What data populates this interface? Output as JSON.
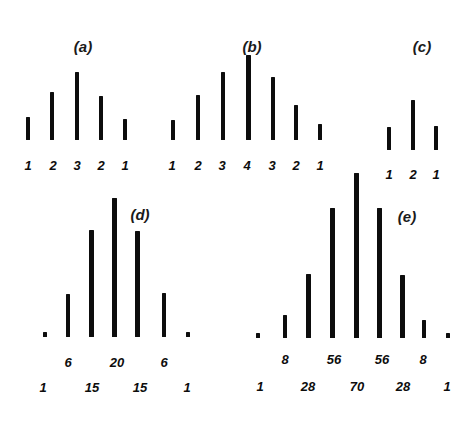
{
  "figure": {
    "background_color": "#ffffff",
    "bar_color": "#0d0d0d",
    "text_color": "#0d0d0d",
    "panel_letters": [
      {
        "text": "(a)",
        "x": 83,
        "y": 38
      },
      {
        "text": "(b)",
        "x": 252,
        "y": 38
      },
      {
        "text": "(c)",
        "x": 422,
        "y": 38
      },
      {
        "text": "(d)",
        "x": 140,
        "y": 206
      },
      {
        "text": "(e)",
        "x": 407,
        "y": 208
      }
    ]
  },
  "chart_data": [
    {
      "id": "a",
      "type": "bar",
      "title": "(a)",
      "categories": [
        "1",
        "2",
        "3",
        "2",
        "1"
      ],
      "values": [
        1,
        2,
        3,
        2,
        1
      ],
      "tick_labels": [
        "1",
        "2",
        "3",
        "2",
        "1"
      ],
      "xlabel": "",
      "ylabel": "",
      "ylim": [
        0,
        4
      ],
      "grid": false,
      "legend": "none",
      "baseline_y": 140,
      "bars": [
        {
          "label": "1",
          "value": 1,
          "x": 28,
          "top": 117,
          "bottom": 140,
          "width": 4
        },
        {
          "label": "2",
          "value": 2,
          "x": 52,
          "top": 92,
          "bottom": 140,
          "width": 4
        },
        {
          "label": "3",
          "value": 3,
          "x": 77,
          "top": 72,
          "bottom": 140,
          "width": 4
        },
        {
          "label": "2",
          "value": 2,
          "x": 101,
          "top": 96,
          "bottom": 140,
          "width": 4
        },
        {
          "label": "1",
          "value": 1,
          "x": 125,
          "top": 119,
          "bottom": 140,
          "width": 4
        }
      ],
      "label_rows": [
        {
          "y": 159,
          "items": [
            {
              "text": "1",
              "x": 28
            },
            {
              "text": "2",
              "x": 53
            },
            {
              "text": "3",
              "x": 77
            },
            {
              "text": "2",
              "x": 101
            },
            {
              "text": "1",
              "x": 125
            }
          ]
        }
      ]
    },
    {
      "id": "b",
      "type": "bar",
      "title": "(b)",
      "categories": [
        "1",
        "2",
        "3",
        "4",
        "3",
        "2",
        "1"
      ],
      "values": [
        1,
        2,
        3,
        4,
        3,
        2,
        1
      ],
      "tick_labels": [
        "1",
        "2",
        "3",
        "4",
        "3",
        "2",
        "1"
      ],
      "xlabel": "",
      "ylabel": "",
      "ylim": [
        0,
        5
      ],
      "grid": false,
      "legend": "none",
      "baseline_y": 140,
      "bars": [
        {
          "label": "1",
          "value": 1,
          "x": 173,
          "top": 120,
          "bottom": 140,
          "width": 4
        },
        {
          "label": "2",
          "value": 2,
          "x": 198,
          "top": 95,
          "bottom": 140,
          "width": 4
        },
        {
          "label": "3",
          "value": 3,
          "x": 223,
          "top": 72,
          "bottom": 140,
          "width": 4
        },
        {
          "label": "4",
          "value": 4,
          "x": 248,
          "top": 55,
          "bottom": 140,
          "width": 5
        },
        {
          "label": "3",
          "value": 3,
          "x": 273,
          "top": 77,
          "bottom": 140,
          "width": 4
        },
        {
          "label": "2",
          "value": 2,
          "x": 296,
          "top": 105,
          "bottom": 140,
          "width": 4
        },
        {
          "label": "1",
          "value": 1,
          "x": 320,
          "top": 124,
          "bottom": 140,
          "width": 4
        }
      ],
      "label_rows": [
        {
          "y": 159,
          "items": [
            {
              "text": "1",
              "x": 172
            },
            {
              "text": "2",
              "x": 198
            },
            {
              "text": "3",
              "x": 222
            },
            {
              "text": "4",
              "x": 247
            },
            {
              "text": "3",
              "x": 272
            },
            {
              "text": "2",
              "x": 296
            },
            {
              "text": "1",
              "x": 320
            }
          ]
        }
      ]
    },
    {
      "id": "c",
      "type": "bar",
      "title": "(c)",
      "categories": [
        "1",
        "2",
        "1"
      ],
      "values": [
        1,
        2,
        1
      ],
      "tick_labels": [
        "1",
        "2",
        "1"
      ],
      "xlabel": "",
      "ylabel": "",
      "ylim": [
        0,
        3
      ],
      "grid": false,
      "legend": "none",
      "baseline_y": 150,
      "bars": [
        {
          "label": "1",
          "value": 1,
          "x": 389,
          "top": 127,
          "bottom": 150,
          "width": 4
        },
        {
          "label": "2",
          "value": 2,
          "x": 413,
          "top": 100,
          "bottom": 150,
          "width": 4
        },
        {
          "label": "1",
          "value": 1,
          "x": 436,
          "top": 126,
          "bottom": 150,
          "width": 4
        }
      ],
      "label_rows": [
        {
          "y": 168,
          "items": [
            {
              "text": "1",
              "x": 389
            },
            {
              "text": "2",
              "x": 413
            },
            {
              "text": "1",
              "x": 436
            }
          ]
        }
      ]
    },
    {
      "id": "d",
      "type": "bar",
      "title": "(d)",
      "categories": [
        "1",
        "6",
        "15",
        "20",
        "15",
        "6",
        "1"
      ],
      "values": [
        1,
        6,
        15,
        20,
        15,
        6,
        1
      ],
      "tick_labels": [
        "1",
        "6",
        "15",
        "20",
        "15",
        "6",
        "1"
      ],
      "xlabel": "",
      "ylabel": "",
      "ylim": [
        0,
        22
      ],
      "grid": false,
      "legend": "none",
      "baseline_y": 337,
      "bars": [
        {
          "label": "1",
          "value": 1,
          "x": 45,
          "top": 332,
          "bottom": 337,
          "width": 4
        },
        {
          "label": "6",
          "value": 6,
          "x": 68,
          "top": 294,
          "bottom": 337,
          "width": 4
        },
        {
          "label": "15",
          "value": 15,
          "x": 91,
          "top": 230,
          "bottom": 337,
          "width": 5
        },
        {
          "label": "20",
          "value": 20,
          "x": 114,
          "top": 198,
          "bottom": 337,
          "width": 5
        },
        {
          "label": "15",
          "value": 15,
          "x": 137,
          "top": 231,
          "bottom": 337,
          "width": 5
        },
        {
          "label": "6",
          "value": 6,
          "x": 164,
          "top": 293,
          "bottom": 337,
          "width": 4
        },
        {
          "label": "1",
          "value": 1,
          "x": 188,
          "top": 332,
          "bottom": 337,
          "width": 4
        }
      ],
      "label_rows": [
        {
          "y": 356,
          "items": [
            {
              "text": "6",
              "x": 68
            },
            {
              "text": "20",
              "x": 117
            },
            {
              "text": "6",
              "x": 164
            }
          ]
        },
        {
          "y": 381,
          "items": [
            {
              "text": "1",
              "x": 43
            },
            {
              "text": "15",
              "x": 92
            },
            {
              "text": "15",
              "x": 140
            },
            {
              "text": "1",
              "x": 187
            }
          ]
        }
      ]
    },
    {
      "id": "e",
      "type": "bar",
      "title": "(e)",
      "categories": [
        "1",
        "8",
        "28",
        "56",
        "70",
        "56",
        "28",
        "8",
        "1"
      ],
      "values": [
        1,
        8,
        28,
        56,
        70,
        56,
        28,
        8,
        1
      ],
      "tick_labels": [
        "1",
        "8",
        "28",
        "56",
        "70",
        "56",
        "28",
        "8",
        "1"
      ],
      "xlabel": "",
      "ylabel": "",
      "ylim": [
        0,
        76
      ],
      "grid": false,
      "legend": "none",
      "baseline_y": 338,
      "bars": [
        {
          "label": "1",
          "value": 1,
          "x": 258,
          "top": 333,
          "bottom": 338,
          "width": 4
        },
        {
          "label": "8",
          "value": 8,
          "x": 285,
          "top": 315,
          "bottom": 338,
          "width": 4
        },
        {
          "label": "28",
          "value": 28,
          "x": 308,
          "top": 274,
          "bottom": 338,
          "width": 5
        },
        {
          "label": "56",
          "value": 56,
          "x": 332,
          "top": 208,
          "bottom": 338,
          "width": 5
        },
        {
          "label": "70",
          "value": 70,
          "x": 356,
          "top": 173,
          "bottom": 338,
          "width": 5
        },
        {
          "label": "56",
          "value": 56,
          "x": 379,
          "top": 208,
          "bottom": 338,
          "width": 5
        },
        {
          "label": "28",
          "value": 28,
          "x": 402,
          "top": 275,
          "bottom": 338,
          "width": 5
        },
        {
          "label": "8",
          "value": 8,
          "x": 424,
          "top": 320,
          "bottom": 338,
          "width": 4
        },
        {
          "label": "1",
          "value": 1,
          "x": 448,
          "top": 333,
          "bottom": 338,
          "width": 4
        }
      ],
      "label_rows": [
        {
          "y": 353,
          "items": [
            {
              "text": "8",
              "x": 285
            },
            {
              "text": "56",
              "x": 334
            },
            {
              "text": "56",
              "x": 382
            },
            {
              "text": "8",
              "x": 423
            }
          ]
        },
        {
          "y": 380,
          "items": [
            {
              "text": "1",
              "x": 260
            },
            {
              "text": "28",
              "x": 308
            },
            {
              "text": "70",
              "x": 357
            },
            {
              "text": "28",
              "x": 403
            },
            {
              "text": "1",
              "x": 447
            }
          ]
        }
      ]
    }
  ]
}
